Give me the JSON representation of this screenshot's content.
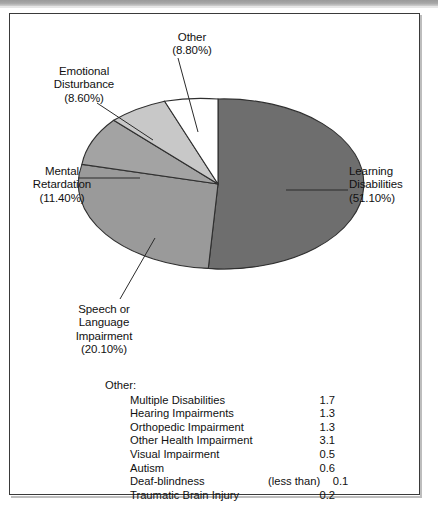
{
  "figure": {
    "type": "pie-chart-figure"
  },
  "chart_data": {
    "type": "pie",
    "title": "",
    "subtitle": "",
    "xlabel": "",
    "ylabel": "",
    "legend_position": "callout-labels",
    "grid": false,
    "units": "percent",
    "categories": [
      "Learning Disabilities",
      "Speech or Language Impairment",
      "Mental Retardation",
      "Emotional Disturbance",
      "Other"
    ],
    "values": [
      51.1,
      20.1,
      11.4,
      8.6,
      8.8
    ],
    "colors": [
      "#6e6e6e",
      "#9a9a9a",
      "#a3a3a3",
      "#c8c8c8",
      "#ffffff"
    ],
    "slices": [
      {
        "name": "Learning Disabilities",
        "value": 51.1,
        "label": "Learning\nDisabilities\n(51.10%)",
        "color": "#6e6e6e"
      },
      {
        "name": "Speech or Language Impairment",
        "value": 20.1,
        "label": "Speech or\nLanguage\nImpairment\n(20.10%)",
        "color": "#9a9a9a"
      },
      {
        "name": "Mental Retardation",
        "value": 11.4,
        "label": "Mental\nRetardation\n(11.40%)",
        "color": "#a3a3a3"
      },
      {
        "name": "Emotional Disturbance",
        "value": 8.6,
        "label": "Emotional\nDisturbance\n(8.60%)",
        "color": "#c8c8c8"
      },
      {
        "name": "Other",
        "value": 8.8,
        "label": "Other\n(8.80%)",
        "color": "#ffffff"
      }
    ],
    "breakdown": {
      "title": "Other:",
      "rows": [
        {
          "name": "Multiple Disabilities",
          "qualifier": "",
          "value": "1.7"
        },
        {
          "name": "Hearing Impairments",
          "qualifier": "",
          "value": "1.3"
        },
        {
          "name": "Orthopedic Impairment",
          "qualifier": "",
          "value": "1.3"
        },
        {
          "name": "Other Health Impairment",
          "qualifier": "",
          "value": "3.1"
        },
        {
          "name": "Visual Impairment",
          "qualifier": "",
          "value": "0.5"
        },
        {
          "name": "Autism",
          "qualifier": "",
          "value": "0.6"
        },
        {
          "name": "Deaf-blindness",
          "qualifier": "(less than)",
          "value": "0.1"
        },
        {
          "name": "Traumatic Brain Injury",
          "qualifier": "",
          "value": "0.2"
        }
      ]
    }
  }
}
